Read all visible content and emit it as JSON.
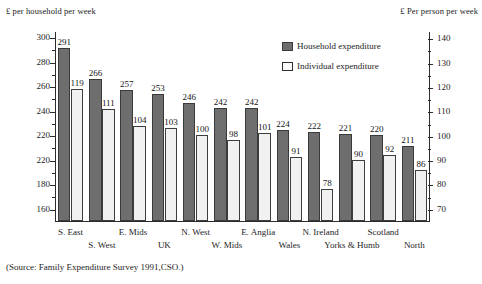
{
  "titles": {
    "left_axis": "£ per household per week",
    "right_axis": "£ Per person per week"
  },
  "legend": {
    "items": [
      {
        "label": "Household expenditure",
        "color": "#6e6e6e",
        "key": "household"
      },
      {
        "label": "Individual expenditure",
        "color": "#f1f1f1",
        "key": "individual"
      }
    ]
  },
  "source": "(Source: Family Expenditure Survey 1991,CSO.)",
  "chart_data": {
    "type": "bar",
    "title": "",
    "xlabel": "",
    "ylabel": "£ per household per week",
    "y2label": "£ Per person per week",
    "grid": false,
    "legend_position": "top-right",
    "categories": [
      "S. East",
      "S. West",
      "E. Mids",
      "UK",
      "N. West",
      "W. Mids",
      "E. Anglia",
      "Wales",
      "N. Ireland",
      "Yorks & Humb",
      "Scotland",
      "North"
    ],
    "categories_note": "11 regional groups are plotted; labels are staggered across two rows",
    "plotted_categories": [
      "S. East",
      "S. West",
      "E. Mids",
      "UK",
      "N. West",
      "W. Mids",
      "E. Anglia",
      "Wales",
      "N. Ireland",
      "Yorks & Humb",
      "Scotland"
    ],
    "series": [
      {
        "name": "Household expenditure",
        "axis": "left",
        "color": "#6e6e6e",
        "values": [
          291,
          266,
          257,
          253,
          246,
          242,
          242,
          224,
          222,
          221,
          220,
          211
        ]
      },
      {
        "name": "Individual expenditure",
        "axis": "right",
        "color": "#f1f1f1",
        "values": [
          119,
          111,
          104,
          103,
          100,
          98,
          101,
          91,
          78,
          90,
          92,
          86
        ]
      }
    ],
    "ylim": [
      150,
      305
    ],
    "y2lim": [
      65,
      143
    ],
    "yticks_major": [
      160,
      180,
      220,
      240,
      260,
      280,
      300
    ],
    "yticks_labels": [
      "160",
      "180",
      "220",
      "220",
      "240",
      "260",
      "280",
      "300"
    ],
    "yticks_note": "the sixth gridline from the bottom is printed '220' in the source scan where 200 is intended",
    "y2ticks": [
      70,
      80,
      90,
      100,
      110,
      120,
      130,
      140
    ]
  },
  "left_axis_ticks": [
    {
      "label": "300",
      "value": 300
    },
    {
      "label": "280",
      "value": 280
    },
    {
      "label": "260",
      "value": 260
    },
    {
      "label": "240",
      "value": 240
    },
    {
      "label": "220",
      "value": 220
    },
    {
      "label": "220",
      "value": 200
    },
    {
      "label": "180",
      "value": 180
    },
    {
      "label": "160",
      "value": 160
    }
  ],
  "right_axis_ticks": [
    {
      "label": "140",
      "value": 140
    },
    {
      "label": "130",
      "value": 130
    },
    {
      "label": "120",
      "value": 120
    },
    {
      "label": "110",
      "value": 110
    },
    {
      "label": "100",
      "value": 100
    },
    {
      "label": "90",
      "value": 90
    },
    {
      "label": "80",
      "value": 80
    },
    {
      "label": "70",
      "value": 70
    }
  ],
  "bar_pairs": [
    {
      "category": "S. East",
      "row": 0,
      "household": 291,
      "individual": 119
    },
    {
      "category": "S. West",
      "row": 1,
      "household": 266,
      "individual": 111
    },
    {
      "category": "E. Mids",
      "row": 0,
      "household": 257,
      "individual": 104
    },
    {
      "category": "UK",
      "row": 1,
      "household": 253,
      "individual": 103
    },
    {
      "category": "N. West",
      "row": 0,
      "household": 246,
      "individual": 100
    },
    {
      "category": "W. Mids",
      "row": 1,
      "household": 242,
      "individual": 98
    },
    {
      "category": "E. Anglia",
      "row": 0,
      "household": 242,
      "individual": 101
    },
    {
      "category": "Wales",
      "row": 1,
      "household": 224,
      "individual": 91
    },
    {
      "category": "N. Ireland",
      "row": 0,
      "household": 222,
      "individual": 78
    },
    {
      "category": "Yorks & Humb",
      "row": 1,
      "household": 221,
      "individual": 90
    },
    {
      "category": "Scotland",
      "row": 0,
      "household": 220,
      "individual": 92
    },
    {
      "category": "North",
      "row": 1,
      "household": 211,
      "individual": 86
    }
  ]
}
